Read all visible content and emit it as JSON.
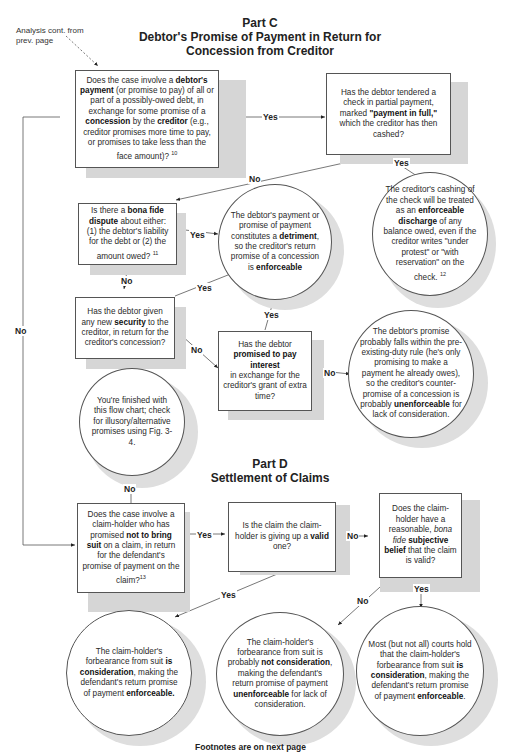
{
  "part_c": {
    "heading": "Part C",
    "title_line1": "Debtor's Promise of Payment in Return for",
    "title_line2": "Concession from Creditor"
  },
  "part_d": {
    "heading": "Part D",
    "title": "Settlement of Claims"
  },
  "entry_note": {
    "line1": "Analysis cont. from",
    "line2": "prev. page"
  },
  "nodes": {
    "q_debtor_payment": {
      "type": "question",
      "html": "Does the case involve a <b>debtor's payment</b> (or promise to pay) of all or part of a possibly-owed debt, in exchange for some promise of a <b>concession</b> by the <b>creditor</b> (e.g., creditor promises more time to pay,  or promises to take less than the face amount)? <sup>10</sup>"
    },
    "q_check_full": {
      "type": "question",
      "html": "Has the debtor tendered a check in partial payment,  marked <b>\"payment in full,\"</b> which the creditor has then cashed?"
    },
    "r_discharge": {
      "type": "result",
      "html": "The creditor's cashing of the check will be treated as an <b>enforceable discharge</b> of any balance owed, even if the creditor writes \"under protest\" or \"with reservation\" on the check. <sup>12</sup>"
    },
    "q_bona_fide": {
      "type": "question",
      "html": "Is there a <b>bona fide dispute</b> about either: (1) the debtor's liability for the debt or (2) the amount owed? <sup>11</sup>"
    },
    "r_detriment": {
      "type": "result",
      "html": "The debtor's payment or promise of payment constitutes a <b>detriment</b>, so the creditor's return promise of a concession  is <b>enforceable</b>"
    },
    "q_security": {
      "type": "question",
      "html": "Has the debtor given any new <b>security</b> to the creditor, in return for the creditor's concession?"
    },
    "q_interest": {
      "type": "question",
      "html": "Has the debtor <b>promised to pay interest</b><br>in exchange for the creditor's grant of extra time?"
    },
    "r_preexisting": {
      "type": "result",
      "html": "The debtor's promise probably  falls within the pre-existing-duty rule (he's only promising to make a payment he already owes), so the creditor's counter-promise of a concession is probably <b>unenforceable</b> for lack of consideration."
    },
    "r_finished": {
      "type": "result",
      "html": "You're finished with this flow chart; check for illusory/alternative promises using Fig. 3-4."
    },
    "q_not_sue": {
      "type": "question",
      "html": "Does the case involve a claim-holder who has promised <b>not to bring suit</b> on a claim, in return for the defendant's promise of payment on the claim?<sup>13</sup>"
    },
    "q_valid": {
      "type": "question",
      "html": "Is the claim the claim-holder is giving up a <b>valid</b> one?"
    },
    "q_belief": {
      "type": "question",
      "html": "Does the claim-holder have a reasonable, <i>bona fide</i> <b>subjective belief</b> that the claim is valid?"
    },
    "r_consideration": {
      "type": "result",
      "html": "The claim-holder's forbearance from suit <b>is consideration</b>, making the defendant's return promise of payment <b>enforceable.</b>"
    },
    "r_not_consideration": {
      "type": "result",
      "html": "The claim-holder's forbearance from suit is probably <b>not consideration</b>, making the defendant's return promise of payment <b>unenforceable</b> for lack of consideration."
    },
    "r_most_courts": {
      "type": "result",
      "html": "Most (but not all) courts hold that the claim-holder's forbearance from suit <b>is consideration</b>, making the defendant's return promise of payment <b>enforceable</b>."
    }
  },
  "edges": [
    {
      "from": "q_debtor_payment",
      "to": "q_check_full",
      "label": "Yes"
    },
    {
      "from": "q_check_full",
      "to": "r_discharge",
      "label": "Yes"
    },
    {
      "from": "q_check_full",
      "to": "q_bona_fide",
      "label": "No"
    },
    {
      "from": "q_debtor_payment",
      "to": "q_not_sue",
      "label": "No"
    },
    {
      "from": "q_bona_fide",
      "to": "r_detriment",
      "label": "Yes"
    },
    {
      "from": "q_bona_fide",
      "to": "q_security",
      "label": "No"
    },
    {
      "from": "q_security",
      "to": "r_detriment",
      "label": "Yes"
    },
    {
      "from": "q_security",
      "to": "q_interest",
      "label": "No"
    },
    {
      "from": "q_interest",
      "to": "r_detriment",
      "label": "Yes"
    },
    {
      "from": "q_interest",
      "to": "r_preexisting",
      "label": "No"
    },
    {
      "from": "q_not_sue",
      "to": "r_finished",
      "label": "No"
    },
    {
      "from": "q_not_sue",
      "to": "q_valid",
      "label": "Yes"
    },
    {
      "from": "q_valid",
      "to": "q_belief",
      "label": "No"
    },
    {
      "from": "q_valid",
      "to": "r_consideration",
      "label": "Yes"
    },
    {
      "from": "q_belief",
      "to": "r_not_consideration",
      "label": "No"
    },
    {
      "from": "q_belief",
      "to": "r_most_courts",
      "label": "Yes"
    }
  ],
  "labels": {
    "yes": "Yes",
    "no": "No"
  },
  "footer": "Footnotes are on next page"
}
